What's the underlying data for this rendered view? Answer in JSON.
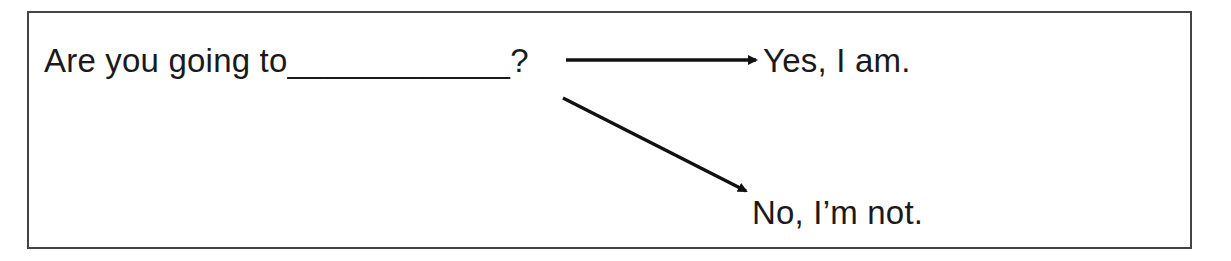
{
  "diagram": {
    "question": "Are you going to____________?",
    "answers": [
      {
        "label": "Yes, I am.",
        "type": "affirmative"
      },
      {
        "label": "No, I’m not.",
        "type": "negative"
      }
    ],
    "colors": {
      "text": "#1a1a1a",
      "border": "#444444",
      "arrow": "#111111",
      "background": "#ffffff"
    }
  }
}
